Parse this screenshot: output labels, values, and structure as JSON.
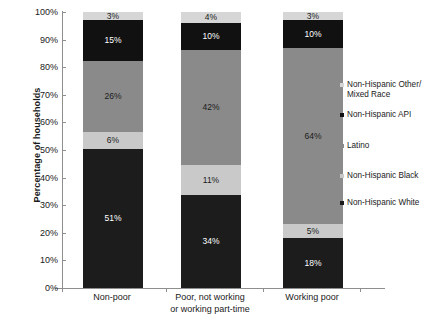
{
  "chart_data": {
    "type": "bar",
    "subtype": "100% stacked column",
    "title": "",
    "xlabel": "",
    "ylabel": "Percentage of households",
    "ylim": [
      0,
      100
    ],
    "yticks": [
      "0%",
      "10%",
      "20%",
      "30%",
      "40%",
      "50%",
      "60%",
      "70%",
      "80%",
      "90%",
      "100%"
    ],
    "grid": false,
    "legend_position": "right",
    "categories": [
      "Non-poor",
      "Poor, not working or working part-time",
      "Working poor"
    ],
    "category_lines": [
      [
        "Non-poor"
      ],
      [
        "Poor, not working",
        "or working part-time"
      ],
      [
        "Working poor"
      ]
    ],
    "series": [
      {
        "name": "Non-Hispanic White",
        "color": "#1c1c1c",
        "label_color": "#ffffff",
        "values": [
          51,
          34,
          18
        ],
        "labels": [
          "51%",
          "34%",
          "18%"
        ]
      },
      {
        "name": "Non-Hispanic Black",
        "color": "#c9c9c9",
        "label_color": "#1a1a1a",
        "values": [
          6,
          11,
          5
        ],
        "labels": [
          "6%",
          "11%",
          "5%"
        ]
      },
      {
        "name": "Latino",
        "color": "#8a8a8a",
        "label_color": "#1a1a1a",
        "values": [
          26,
          42,
          64
        ],
        "labels": [
          "26%",
          "42%",
          "64%"
        ]
      },
      {
        "name": "Non-Hispanic API",
        "color": "#111111",
        "label_color": "#ffffff",
        "values": [
          15,
          10,
          10
        ],
        "labels": [
          "15%",
          "10%",
          "10%"
        ]
      },
      {
        "name": "Non-Hispanic Other/ Mixed Race",
        "color": "#d6d6d6",
        "label_color": "#1a1a1a",
        "values": [
          3,
          4,
          3
        ],
        "labels": [
          "3%",
          "4%",
          "3%"
        ]
      }
    ]
  },
  "legend": {
    "items": [
      {
        "label_line1": "Non-Hispanic Other/",
        "label_line2": "Mixed Race",
        "color": "#d6d6d6"
      },
      {
        "label_line1": "Non-Hispanic API",
        "label_line2": "",
        "color": "#111111"
      },
      {
        "label_line1": "Latino",
        "label_line2": "",
        "color": "#8a8a8a"
      },
      {
        "label_line1": "Non-Hispanic Black",
        "label_line2": "",
        "color": "#c9c9c9"
      },
      {
        "label_line1": "Non-Hispanic White",
        "label_line2": "",
        "color": "#1c1c1c"
      }
    ]
  },
  "axis": {
    "y_title": "Percentage of households"
  }
}
